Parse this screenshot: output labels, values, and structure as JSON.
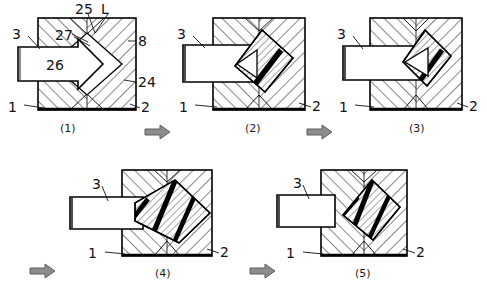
{
  "figure": {
    "type": "patent-sequence-diagram",
    "panel_count": 5,
    "background_color": "#ffffff",
    "line_color": "#000000",
    "hatch_color": "#1a1a1a",
    "band_color": "#000000",
    "flow_arrow_color": "#8c8c8c",
    "flow_arrow_stroke": "#5f5f5f"
  },
  "panels": [
    {
      "id": "panel-1",
      "caption": "(1)",
      "labels": [
        {
          "key": "label-25",
          "text": "25"
        },
        {
          "key": "label-L",
          "text": "L"
        },
        {
          "key": "label-27",
          "text": "27"
        },
        {
          "key": "label-3",
          "text": "3"
        },
        {
          "key": "label-26",
          "text": "26"
        },
        {
          "key": "label-8",
          "text": "8"
        },
        {
          "key": "label-24",
          "text": "24"
        },
        {
          "key": "label-1",
          "text": "1"
        },
        {
          "key": "label-2",
          "text": "2"
        }
      ],
      "stage_note": "Initial position: arrow-shaped punch (26) at mouth of cavity, diamond void fully open.",
      "bands": 0
    },
    {
      "id": "panel-2",
      "caption": "(2)",
      "labels": [
        {
          "key": "label-3",
          "text": "3"
        },
        {
          "key": "label-1",
          "text": "1"
        },
        {
          "key": "label-2",
          "text": "2"
        }
      ],
      "stage_note": "Punch advanced; two thick black bands appear along the inclined diamond faces.",
      "bands": 2
    },
    {
      "id": "panel-3",
      "caption": "(3)",
      "labels": [
        {
          "key": "label-3",
          "text": "3"
        },
        {
          "key": "label-1",
          "text": "1"
        },
        {
          "key": "label-2",
          "text": "2"
        }
      ],
      "stage_note": "Punch driven deeper; bands shift right and narrow as the void collapses.",
      "bands": 2
    },
    {
      "id": "panel-4",
      "caption": "(4)",
      "labels": [
        {
          "key": "label-3",
          "text": "3"
        },
        {
          "key": "label-1",
          "text": "1"
        },
        {
          "key": "label-2",
          "text": "2"
        }
      ],
      "stage_note": "Punch bar fully engaged; a broad striped diamond with three black bands spans the cavity.",
      "bands": 3
    },
    {
      "id": "panel-5",
      "caption": "(5)",
      "labels": [
        {
          "key": "label-3",
          "text": "3"
        },
        {
          "key": "label-1",
          "text": "1"
        },
        {
          "key": "label-2",
          "text": "2"
        }
      ],
      "stage_note": "Final stage; compacted striped diamond seated toward the upper-right of the die.",
      "bands": 3
    }
  ],
  "flow_arrows": [
    {
      "key": "flow-arrow-1-2",
      "from": "(1)",
      "to": "(2)"
    },
    {
      "key": "flow-arrow-2-3",
      "from": "(2)",
      "to": "(3)"
    },
    {
      "key": "flow-arrow-3-4",
      "from": "(3)",
      "to": "(4)"
    },
    {
      "key": "flow-arrow-4-5",
      "from": "(4)",
      "to": "(5)"
    }
  ],
  "captions": {
    "p1": "(1)",
    "p2": "(2)",
    "p3": "(3)",
    "p4": "(4)",
    "p5": "(5)"
  },
  "reference_numerals": {
    "die_lower": "1",
    "die_right": "2",
    "punch_bar": "3",
    "upper_face": "8",
    "right_flank": "24",
    "apex": "25",
    "arrow_body": "26",
    "left_flank": "27",
    "length_marker": "L"
  }
}
